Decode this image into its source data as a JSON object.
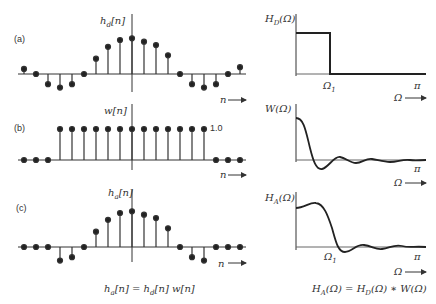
{
  "left": {
    "panel_a": {
      "tag": "(a)",
      "ylabel": "h_d[n]",
      "xlabel": "n"
    },
    "panel_b": {
      "tag": "(b)",
      "ylabel": "w[n]",
      "xlabel": "n",
      "level_label": "1.0"
    },
    "panel_c": {
      "tag": "(c)",
      "ylabel": "h_a[n]",
      "xlabel": "n",
      "caption": "h_a[n] = h_d[n] w[n]"
    }
  },
  "right": {
    "panel_a": {
      "ylabel": "H_D(Ω)",
      "xtick1": "Ω₁",
      "xtick2": "π",
      "xlabel": "Ω"
    },
    "panel_b": {
      "ylabel": "W(Ω)",
      "xtick2": "π",
      "xlabel": "Ω"
    },
    "panel_c": {
      "ylabel": "H_A(Ω)",
      "xtick1": "Ω₁",
      "xtick2": "π",
      "xlabel": "Ω",
      "caption": "H_A(Ω) = H_D(Ω) ∗ W(Ω)"
    }
  },
  "chart_data": [
    {
      "type": "stem",
      "title": "(a) h_d[n]",
      "x": [
        -9,
        -8,
        -7,
        -6,
        -5,
        -4,
        -3,
        -2,
        -1,
        0,
        1,
        2,
        3,
        4,
        5,
        6,
        7,
        8,
        9
      ],
      "values": [
        0.15,
        0,
        -0.3,
        -0.4,
        -0.3,
        0,
        0.45,
        0.8,
        1.0,
        1.05,
        0.95,
        0.85,
        0.55,
        0,
        -0.3,
        -0.4,
        -0.3,
        0,
        0.2
      ]
    },
    {
      "type": "stem",
      "title": "(b) w[n]",
      "x": [
        -9,
        -8,
        -7,
        -6,
        -5,
        -4,
        -3,
        -2,
        -1,
        0,
        1,
        2,
        3,
        4,
        5,
        6,
        7,
        8,
        9
      ],
      "values": [
        0,
        0,
        0,
        1,
        1,
        1,
        1,
        1,
        1,
        1,
        1,
        1,
        1,
        1,
        1,
        1,
        0,
        0,
        0
      ],
      "annotation": "1.0"
    },
    {
      "type": "stem",
      "title": "(c) h_a[n]",
      "x": [
        -9,
        -8,
        -7,
        -6,
        -5,
        -4,
        -3,
        -2,
        -1,
        0,
        1,
        2,
        3,
        4,
        5,
        6,
        7,
        8,
        9
      ],
      "values": [
        0,
        0,
        0,
        -0.4,
        -0.3,
        0,
        0.45,
        0.8,
        1.0,
        1.05,
        0.95,
        0.85,
        0.55,
        0,
        -0.3,
        -0.4,
        0,
        0,
        0
      ]
    },
    {
      "type": "line",
      "title": "H_D(Ω)",
      "xlabel": "Ω",
      "description": "ideal lowpass: 1 for Ω<Ω1, 0 for Ω1<Ω<π"
    },
    {
      "type": "line",
      "title": "W(Ω)",
      "xlabel": "Ω",
      "description": "sinc-like main lobe with decaying ripples"
    },
    {
      "type": "line",
      "title": "H_A(Ω)",
      "xlabel": "Ω",
      "description": "smoothed lowpass with overshoot and ripples near Ω1"
    }
  ]
}
